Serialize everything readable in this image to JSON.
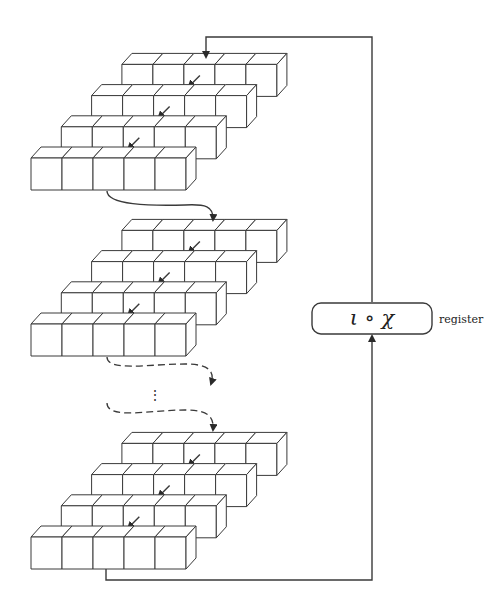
{
  "diagram": {
    "type": "iterated-round-function",
    "register_box": {
      "label": "ι ∘ χ"
    },
    "side_label": "register",
    "ellipsis": "⋮",
    "groups": [
      {
        "name": "state-1",
        "rows": 4,
        "columns": 5,
        "arrow_column": 2
      },
      {
        "name": "state-2",
        "rows": 4,
        "columns": 5,
        "arrow_column": 2
      },
      {
        "name": "state-n",
        "rows": 4,
        "columns": 5,
        "arrow_column": 2
      }
    ],
    "connectors": [
      {
        "from": "state-1",
        "to": "state-2",
        "style": "solid"
      },
      {
        "from": "state-2",
        "to": "ellipsis",
        "style": "dashed"
      },
      {
        "from": "ellipsis",
        "to": "state-n",
        "style": "dashed"
      },
      {
        "from": "state-n",
        "to": "register",
        "style": "solid"
      },
      {
        "from": "register",
        "to": "state-1",
        "style": "solid"
      }
    ],
    "colors": {
      "line": "#3a3a3a",
      "fill": "#ffffff"
    }
  }
}
